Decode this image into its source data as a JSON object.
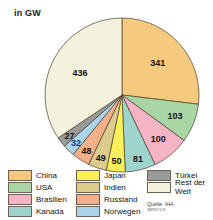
{
  "unit_label": "in GW",
  "source": {
    "line1": "Quelle: IHA",
    "line2": "38957CX"
  },
  "legend": {
    "columns": [
      {
        "items": [
          {
            "label": "China",
            "color": "#f5c97e"
          },
          {
            "label": "USA",
            "color": "#aad6a6"
          },
          {
            "label": "Brasilien",
            "color": "#f5b4c6"
          },
          {
            "label": "Kanada",
            "color": "#9fd4ce"
          }
        ]
      },
      {
        "items": [
          {
            "label": "Japan",
            "color": "#f9f05a"
          },
          {
            "label": "Indien",
            "color": "#ddcb8e"
          },
          {
            "label": "Russland",
            "color": "#f5b089"
          },
          {
            "label": "Norwegen",
            "color": "#aad3ee"
          }
        ]
      },
      {
        "items": [
          {
            "label": "Türkei",
            "color": "#9a9a9a"
          },
          {
            "label": "Rest der Welt",
            "color": "#f4f2dd"
          }
        ]
      }
    ]
  },
  "chart_data": {
    "type": "pie",
    "title": "",
    "unit": "GW",
    "ylabel": "",
    "xlabel": "",
    "total": 1267,
    "start_angle_deg": 0,
    "direction": "clockwise",
    "legend_position": "bottom",
    "categories": [
      "China",
      "USA",
      "Brasilien",
      "Kanada",
      "Japan",
      "Indien",
      "Russland",
      "Norwegen",
      "Türkei",
      "Rest der Welt"
    ],
    "values": [
      341,
      103,
      100,
      81,
      50,
      49,
      48,
      32,
      27,
      436
    ],
    "colors": [
      "#f5c97e",
      "#aad6a6",
      "#f5b4c6",
      "#9fd4ce",
      "#f9f05a",
      "#ddcb8e",
      "#f5b089",
      "#aad3ee",
      "#9a9a9a",
      "#f4f2dd"
    ],
    "label_colors": [
      "#141414",
      "#141414",
      "#141414",
      "#141414",
      "#141414",
      "#141414",
      "#141414",
      "#123a78",
      "#141414",
      "#141414"
    ],
    "slices": [
      {
        "name": "China",
        "value": 341,
        "color": "#f5c97e",
        "label": "341"
      },
      {
        "name": "USA",
        "value": 103,
        "color": "#aad6a6",
        "label": "103"
      },
      {
        "name": "Brasilien",
        "value": 100,
        "color": "#f5b4c6",
        "label": "100"
      },
      {
        "name": "Kanada",
        "value": 81,
        "color": "#9fd4ce",
        "label": "81"
      },
      {
        "name": "Japan",
        "value": 50,
        "color": "#f9f05a",
        "label": "50"
      },
      {
        "name": "Indien",
        "value": 49,
        "color": "#ddcb8e",
        "label": "49"
      },
      {
        "name": "Russland",
        "value": 48,
        "color": "#f5b089",
        "label": "48"
      },
      {
        "name": "Norwegen",
        "value": 32,
        "color": "#aad3ee",
        "label": "32"
      },
      {
        "name": "Türkei",
        "value": 27,
        "color": "#9a9a9a",
        "label": "27"
      },
      {
        "name": "Rest der Welt",
        "value": 436,
        "color": "#f4f2dd",
        "label": "436"
      }
    ]
  }
}
